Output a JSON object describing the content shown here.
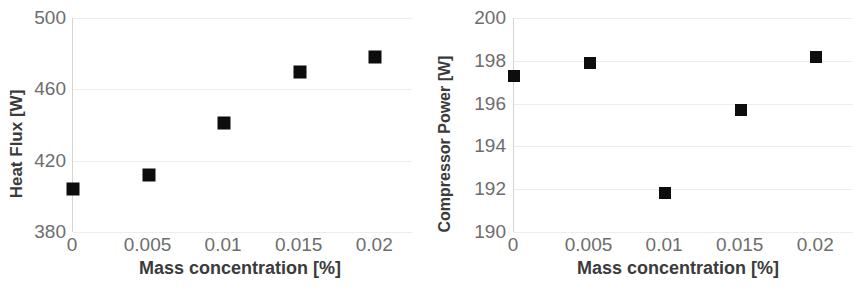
{
  "chart_data": [
    {
      "type": "scatter",
      "title": "",
      "xlabel": "Mass concentration [%]",
      "ylabel": "Heat Flux [W]",
      "x": [
        0,
        0.005,
        0.01,
        0.015,
        0.02
      ],
      "values": [
        404,
        412,
        441,
        470,
        478
      ],
      "xtick_labels": [
        "0",
        "0.005",
        "0.01",
        "0.015",
        "0.02"
      ],
      "ytick_labels": [
        "500",
        "460",
        "420",
        "380"
      ],
      "ytick_values": [
        500,
        460,
        420,
        380
      ],
      "xlim": [
        0,
        0.0225
      ],
      "ylim": [
        380,
        500
      ],
      "grid": true,
      "legend": "none",
      "marker": "square",
      "marker_color": "#0d0d0d"
    },
    {
      "type": "scatter",
      "title": "",
      "xlabel": "Mass concentration [%]",
      "ylabel": "Compressor Power [W]",
      "x": [
        0,
        0.005,
        0.01,
        0.015,
        0.02
      ],
      "values": [
        197.3,
        197.9,
        191.8,
        195.7,
        198.2
      ],
      "xtick_labels": [
        "0",
        "0.005",
        "0.01",
        "0.015",
        "0.02"
      ],
      "ytick_labels": [
        "200",
        "198",
        "196",
        "194",
        "192",
        "190"
      ],
      "ytick_values": [
        200,
        198,
        196,
        194,
        192,
        190
      ],
      "xlim": [
        0,
        0.0225
      ],
      "ylim": [
        190,
        200
      ],
      "grid": true,
      "legend": "none",
      "marker": "square",
      "marker_color": "#0d0d0d"
    }
  ]
}
